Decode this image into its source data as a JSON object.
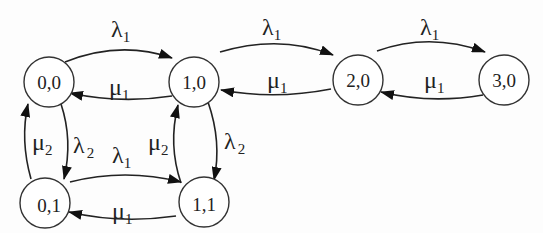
{
  "diagram": {
    "type": "state-transition-diagram",
    "nodes": [
      {
        "id": "n00",
        "label": "0,0"
      },
      {
        "id": "n10",
        "label": "1,0"
      },
      {
        "id": "n20",
        "label": "2,0"
      },
      {
        "id": "n30",
        "label": "3,0"
      },
      {
        "id": "n01",
        "label": "0,1"
      },
      {
        "id": "n11",
        "label": "1,1"
      }
    ],
    "edges": [
      {
        "from": "0,0",
        "to": "1,0",
        "symbol": "λ",
        "subscript": "1"
      },
      {
        "from": "1,0",
        "to": "0,0",
        "symbol": "μ",
        "subscript": "1"
      },
      {
        "from": "1,0",
        "to": "2,0",
        "symbol": "λ",
        "subscript": "1"
      },
      {
        "from": "2,0",
        "to": "1,0",
        "symbol": "μ",
        "subscript": "1"
      },
      {
        "from": "2,0",
        "to": "3,0",
        "symbol": "λ",
        "subscript": "1"
      },
      {
        "from": "3,0",
        "to": "2,0",
        "symbol": "μ",
        "subscript": "1"
      },
      {
        "from": "0,0",
        "to": "0,1",
        "symbol": "λ",
        "subscript": "2"
      },
      {
        "from": "0,1",
        "to": "0,0",
        "symbol": "μ",
        "subscript": "2"
      },
      {
        "from": "1,0",
        "to": "1,1",
        "symbol": "λ",
        "subscript": "2"
      },
      {
        "from": "1,1",
        "to": "1,0",
        "symbol": "μ",
        "subscript": "2"
      },
      {
        "from": "0,1",
        "to": "1,1",
        "symbol": "λ",
        "subscript": "1"
      },
      {
        "from": "1,1",
        "to": "0,1",
        "symbol": "μ",
        "subscript": "1"
      }
    ]
  }
}
